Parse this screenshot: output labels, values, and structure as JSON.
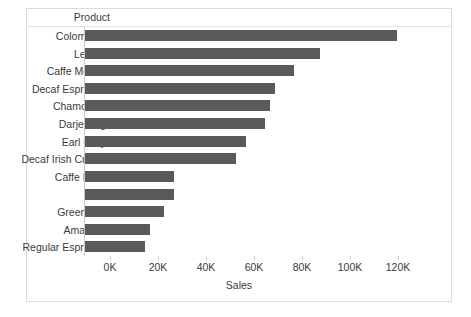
{
  "chart_data": {
    "type": "bar",
    "orientation": "horizontal",
    "title": "",
    "xlabel": "Sales",
    "ylabel": "Product",
    "categories": [
      "Colombian",
      "Lemon",
      "Caffe Mocha",
      "Decaf Espresso",
      "Chamomile",
      "Darjeeling",
      "Earl Grey",
      "Decaf Irish Cream",
      "Caffe Latte",
      "Mint",
      "Green Tea",
      "Amaretto",
      "Regular Espresso"
    ],
    "values": [
      130000,
      98000,
      87000,
      79000,
      77000,
      75000,
      67000,
      63000,
      37000,
      37000,
      33000,
      27000,
      25000
    ],
    "xlim": [
      0,
      141667
    ],
    "xticks": [
      0,
      20000,
      40000,
      60000,
      80000,
      100000,
      120000
    ],
    "xtick_labels": [
      "0K",
      "20K",
      "40K",
      "60K",
      "80K",
      "100K",
      "120K"
    ],
    "grid": false,
    "legend": false,
    "bar_color": "#5a5a5a",
    "sorted": "descending"
  },
  "axes": {
    "product_header": "Product",
    "sales_title": "Sales"
  },
  "colors": {
    "bar": "#5a5a5a",
    "frame": "#dcdcdc",
    "rule": "#e2e2e2",
    "zero_line": "#c8c8c8",
    "text": "#3b3b3b",
    "background": "#ffffff"
  }
}
